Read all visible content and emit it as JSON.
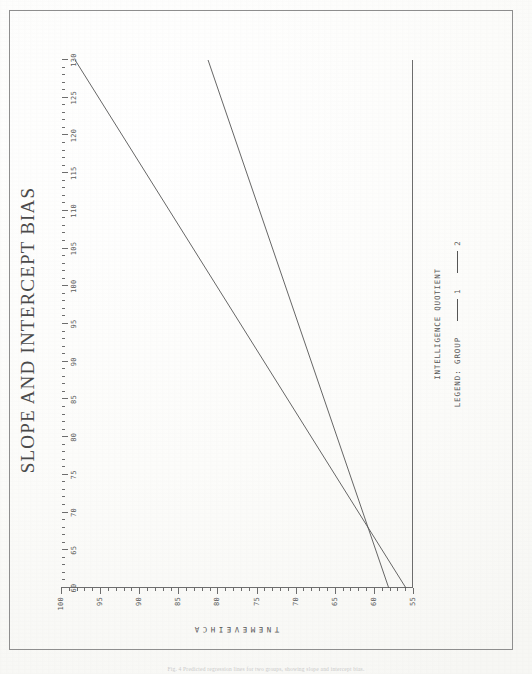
{
  "page": {
    "caption": "Fig. 4 Predicted regression lines for two groups, showing slope and intercept bias."
  },
  "chart_data": {
    "type": "line",
    "title": "SLOPE AND INTERCEPT BIAS",
    "xlabel": "INTELLIGENCE QUOTIENT",
    "ylabel": "ACHIEVEMENT",
    "ylabel_letters": [
      "A",
      "C",
      "H",
      "I",
      "E",
      "V",
      "E",
      "M",
      "E",
      "N",
      "T"
    ],
    "xlim": [
      60,
      130
    ],
    "ylim": [
      55,
      100
    ],
    "xticks": [
      60,
      65,
      70,
      75,
      80,
      85,
      90,
      95,
      100,
      105,
      110,
      115,
      120,
      125,
      130
    ],
    "yticks": [
      55,
      60,
      65,
      70,
      75,
      80,
      85,
      90,
      95,
      100
    ],
    "xtick_labels": [
      "60",
      "65",
      "70",
      "75",
      "80",
      "85",
      "90",
      "95",
      "100",
      "105",
      "110",
      "115",
      "120",
      "125",
      "130"
    ],
    "ytick_labels": [
      "55",
      "60",
      "65",
      "70",
      "75",
      "80",
      "85",
      "90",
      "95",
      "100"
    ],
    "x_minor_step": 1,
    "y_minor_step": 1,
    "grid": false,
    "legend_position": "below-axis",
    "legend_title": "LEGEND: GROUP",
    "series": [
      {
        "name": "1",
        "label": "1",
        "color": "#555555",
        "points": [
          [
            60,
            55.9
          ],
          [
            130,
            98.2
          ]
        ],
        "slope": 0.604,
        "intercept": 19.6
      },
      {
        "name": "2",
        "label": "2",
        "color": "#555555",
        "points": [
          [
            60,
            58.1
          ],
          [
            130,
            81.2
          ]
        ],
        "slope": 0.33,
        "intercept": 38.3
      }
    ],
    "annotations": [
      {
        "text": "lines intersect near IQ 67, achievement 60"
      }
    ]
  }
}
